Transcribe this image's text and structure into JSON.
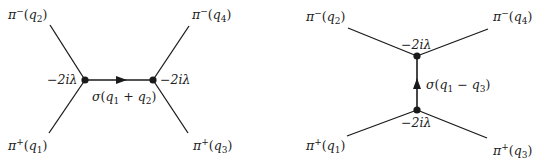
{
  "diagrams": [
    {
      "name": "s-channel",
      "external": {
        "top_left": {
          "particle": "π",
          "charge": "−",
          "momentum": "q",
          "index": "2"
        },
        "top_right": {
          "particle": "π",
          "charge": "−",
          "momentum": "q",
          "index": "4"
        },
        "bottom_left": {
          "particle": "π",
          "charge": "+",
          "momentum": "q",
          "index": "1"
        },
        "bottom_right": {
          "particle": "π",
          "charge": "+",
          "momentum": "q",
          "index": "3"
        }
      },
      "vertex_factor_left": "−2iλ",
      "vertex_factor_right": "−2iλ",
      "propagator": {
        "field": "σ",
        "momentum_a": "q",
        "index_a": "1",
        "op": "+",
        "momentum_b": "q",
        "index_b": "2"
      }
    },
    {
      "name": "t-channel",
      "external": {
        "top_left": {
          "particle": "π",
          "charge": "−",
          "momentum": "q",
          "index": "2"
        },
        "top_right": {
          "particle": "π",
          "charge": "−",
          "momentum": "q",
          "index": "4"
        },
        "bottom_left": {
          "particle": "π",
          "charge": "+",
          "momentum": "q",
          "index": "1"
        },
        "bottom_right": {
          "particle": "π",
          "charge": "+",
          "momentum": "q",
          "index": "3"
        }
      },
      "vertex_factor_top": "−2iλ",
      "vertex_factor_bottom": "−2iλ",
      "propagator": {
        "field": "σ",
        "momentum_a": "q",
        "index_a": "1",
        "op": "−",
        "momentum_b": "q",
        "index_b": "3"
      }
    }
  ],
  "colors": {
    "line": "#1a1a1a",
    "text": "#222222",
    "background": "#ffffff"
  }
}
